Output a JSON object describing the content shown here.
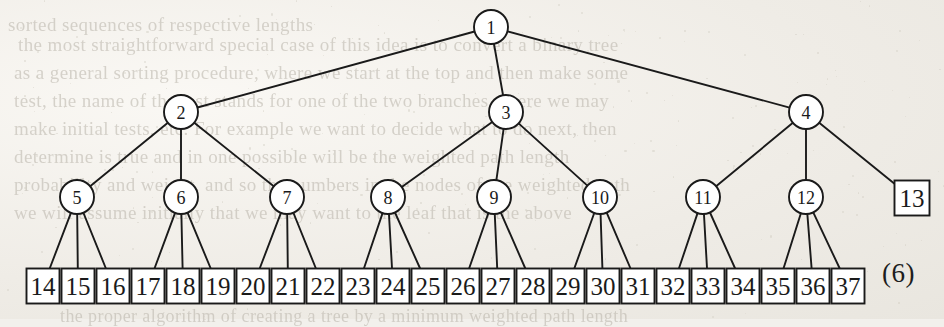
{
  "figure": {
    "caption_number": "(6)",
    "node_shapes": {
      "circle": "internal-node",
      "square": "leaf-node"
    },
    "stroke_color": "#1a1a1a",
    "fill_color": "#ffffff",
    "root": {
      "id": 1,
      "label": "1",
      "shape": "circle",
      "cx": 491,
      "cy": 27,
      "r": 17
    },
    "level2": [
      {
        "id": 2,
        "label": "2",
        "shape": "circle",
        "cx": 181,
        "cy": 112,
        "r": 17
      },
      {
        "id": 3,
        "label": "3",
        "shape": "circle",
        "cx": 506,
        "cy": 112,
        "r": 17
      },
      {
        "id": 4,
        "label": "4",
        "shape": "circle",
        "cx": 806,
        "cy": 112,
        "r": 17
      }
    ],
    "level3": [
      {
        "id": 5,
        "label": "5",
        "shape": "circle",
        "cx": 77,
        "cy": 197,
        "r": 17,
        "parent": 2
      },
      {
        "id": 6,
        "label": "6",
        "shape": "circle",
        "cx": 181,
        "cy": 197,
        "r": 17,
        "parent": 2
      },
      {
        "id": 7,
        "label": "7",
        "shape": "circle",
        "cx": 287,
        "cy": 197,
        "r": 17,
        "parent": 2
      },
      {
        "id": 8,
        "label": "8",
        "shape": "circle",
        "cx": 388,
        "cy": 197,
        "r": 17,
        "parent": 3
      },
      {
        "id": 9,
        "label": "9",
        "shape": "circle",
        "cx": 494,
        "cy": 197,
        "r": 17,
        "parent": 3
      },
      {
        "id": 10,
        "label": "10",
        "shape": "circle",
        "cx": 600,
        "cy": 197,
        "r": 17,
        "parent": 3
      },
      {
        "id": 11,
        "label": "11",
        "shape": "circle",
        "cx": 703,
        "cy": 197,
        "r": 17,
        "parent": 4
      },
      {
        "id": 12,
        "label": "12",
        "shape": "circle",
        "cx": 806,
        "cy": 197,
        "r": 17,
        "parent": 4
      },
      {
        "id": 13,
        "label": "13",
        "shape": "square",
        "cx": 912,
        "cy": 198,
        "size": 35,
        "parent": 4
      }
    ],
    "leaves": [
      {
        "id": 14,
        "label": "14",
        "cx": 43,
        "parent": 5
      },
      {
        "id": 15,
        "label": "15",
        "cx": 78,
        "parent": 5
      },
      {
        "id": 16,
        "label": "16",
        "cx": 113,
        "parent": 5
      },
      {
        "id": 17,
        "label": "17",
        "cx": 148,
        "parent": 6
      },
      {
        "id": 18,
        "label": "18",
        "cx": 183,
        "parent": 6
      },
      {
        "id": 19,
        "label": "19",
        "cx": 218,
        "parent": 6
      },
      {
        "id": 20,
        "label": "20",
        "cx": 253,
        "parent": 7
      },
      {
        "id": 21,
        "label": "21",
        "cx": 288,
        "parent": 7
      },
      {
        "id": 22,
        "label": "22",
        "cx": 323,
        "parent": 7
      },
      {
        "id": 23,
        "label": "23",
        "cx": 358,
        "parent": 8
      },
      {
        "id": 24,
        "label": "24",
        "cx": 393,
        "parent": 8
      },
      {
        "id": 25,
        "label": "25",
        "cx": 428,
        "parent": 8
      },
      {
        "id": 26,
        "label": "26",
        "cx": 463,
        "parent": 9
      },
      {
        "id": 27,
        "label": "27",
        "cx": 498,
        "parent": 9
      },
      {
        "id": 28,
        "label": "28",
        "cx": 533,
        "parent": 9
      },
      {
        "id": 29,
        "label": "29",
        "cx": 568,
        "parent": 10
      },
      {
        "id": 30,
        "label": "30",
        "cx": 603,
        "parent": 10
      },
      {
        "id": 31,
        "label": "31",
        "cx": 638,
        "parent": 10
      },
      {
        "id": 32,
        "label": "32",
        "cx": 673,
        "parent": 11
      },
      {
        "id": 33,
        "label": "33",
        "cx": 708,
        "parent": 11
      },
      {
        "id": 34,
        "label": "34",
        "cx": 743,
        "parent": 11
      },
      {
        "id": 35,
        "label": "35",
        "cx": 778,
        "parent": 12
      },
      {
        "id": 36,
        "label": "36",
        "cx": 813,
        "parent": 12
      },
      {
        "id": 37,
        "label": "37",
        "cx": 848,
        "parent": 12
      }
    ],
    "leaf_row": {
      "cy": 286,
      "w": 33,
      "h": 35
    }
  },
  "background_text": {
    "note": "faint mirrored bleed-through text from the reverse side of the scanned page",
    "lines": [
      {
        "text": "sorted sequences of respective lengths",
        "x": 8,
        "y": 14,
        "size": 19,
        "mirror": false
      },
      {
        "text": "the most straightforward special case of this idea is to convert a binary tree",
        "x": 18,
        "y": 34,
        "size": 19,
        "mirror": false
      },
      {
        "text": "as a general sorting procedure, where we start at the top and then make some",
        "x": 14,
        "y": 62,
        "size": 19,
        "mirror": false
      },
      {
        "text": "test, the name of the test stands for one of the two branches where we may",
        "x": 14,
        "y": 90,
        "size": 19,
        "mirror": false
      },
      {
        "text": "make initial tests, etc. For example we want to decide what to do next, then",
        "x": 14,
        "y": 118,
        "size": 19,
        "mirror": false
      },
      {
        "text": "determine is true and in one possible will be the weighted path length",
        "x": 14,
        "y": 146,
        "size": 19,
        "mirror": false
      },
      {
        "text": "probability and weight, and so the numbers in the nodes of the weighted path",
        "x": 14,
        "y": 174,
        "size": 19,
        "mirror": false
      },
      {
        "text": "we will assume initially that we may want to the leaf that is the above",
        "x": 14,
        "y": 202,
        "size": 19,
        "mirror": false
      },
      {
        "text": "the proper algorithm of creating a tree by a minimum weighted path length",
        "x": 60,
        "y": 306,
        "size": 18,
        "mirror": false
      }
    ]
  }
}
